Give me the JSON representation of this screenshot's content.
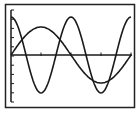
{
  "chart_data": {
    "type": "line",
    "title": "",
    "xlabel": "",
    "ylabel": "",
    "grid": false,
    "legend": null,
    "x_ticks": 4,
    "y_ticks": 10,
    "series": [
      {
        "name": "curve-1 (cosine, larger amplitude, shorter period)",
        "function": "A*cos(2x)",
        "amplitude": 4,
        "period_units": "half of x-range",
        "points_desc": "starts at max at left edge, min at first x-tick, max at mid, min at third tick region, max at right edge"
      },
      {
        "name": "curve-2 (sine, smaller amplitude, longer period)",
        "function": "B*sin(x)",
        "amplitude": 3,
        "period_units": "full x-range",
        "points_desc": "starts at origin, peak near first x-tick, crosses axis at middle, trough near third tick, returns to axis at right edge"
      }
    ]
  },
  "screen": {
    "frame_color": "#222222",
    "curve_color": "#1a1a1a",
    "background": "#ffffff"
  }
}
